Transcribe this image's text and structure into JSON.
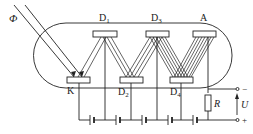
{
  "diagram": {
    "labels": {
      "flux": "Φ",
      "cathode": "K",
      "anode": "A",
      "dynode1_main": "D",
      "dynode1_sub": "1",
      "dynode2_main": "D",
      "dynode2_sub": "2",
      "dynode3_main": "D",
      "dynode3_sub": "3",
      "dynode4_main": "D",
      "dynode4_sub": "4",
      "resistor": "R",
      "voltage": "U",
      "terminal_negative": "−",
      "terminal_positive": "+"
    },
    "colors": {
      "stroke": "#222222",
      "background": "#ffffff"
    }
  }
}
